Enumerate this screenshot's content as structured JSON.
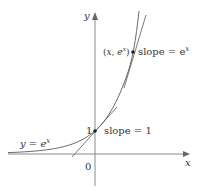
{
  "diagram": {
    "type": "function-graph",
    "function_label": "y = e^x",
    "axes": {
      "x_label": "x",
      "y_label": "y",
      "origin_label": "0",
      "y_tick_label": "1"
    },
    "points": [
      {
        "name": "point-0-1",
        "label": "",
        "annotation": "slope = 1"
      },
      {
        "name": "point-x-ex",
        "label": "(x, e^x)",
        "annotation": "slope = e^x"
      }
    ],
    "colors": {
      "curve": "#666666",
      "axis": "#888888",
      "text": "#333333",
      "point": "#222222"
    }
  },
  "labels": {
    "y_axis": "y",
    "x_axis": "x",
    "origin": "0",
    "one": "1",
    "slope_one": "slope = 1",
    "slope_ex_prefix": "slope = e",
    "slope_ex_sup": "x",
    "point_open": "(",
    "point_x": "x",
    "point_comma": ", e",
    "point_sup": "x",
    "point_close": ")",
    "curve_y": "y = e",
    "curve_sup": "x"
  }
}
